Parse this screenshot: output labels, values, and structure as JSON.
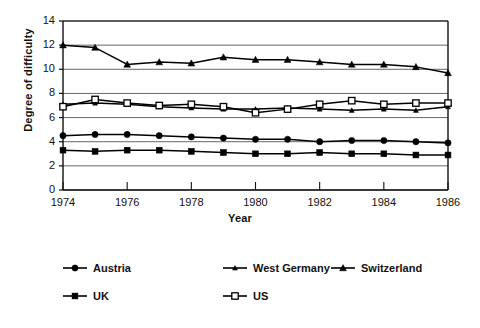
{
  "chart_data": {
    "type": "line",
    "title": "",
    "xlabel": "Year",
    "ylabel": "Degree of difficulty",
    "xlim": [
      1974,
      1986
    ],
    "ylim": [
      0,
      14
    ],
    "ytick_step": 2,
    "xtick_step": 2,
    "grid": "horizontal",
    "legend_position": "below",
    "x": [
      1974,
      1975,
      1976,
      1977,
      1978,
      1979,
      1980,
      1981,
      1982,
      1983,
      1984,
      1985,
      1986
    ],
    "xtick_labels": [
      "1974",
      "1976",
      "1978",
      "1980",
      "1982",
      "1984",
      "1986"
    ],
    "ytick_labels": [
      "0",
      "2",
      "4",
      "6",
      "8",
      "10",
      "12",
      "14"
    ],
    "series": [
      {
        "name": "Austria",
        "marker": "filled-circle",
        "color": "#000000",
        "values": [
          4.5,
          4.6,
          4.6,
          4.5,
          4.4,
          4.3,
          4.2,
          4.2,
          4.0,
          4.1,
          4.1,
          4.0,
          3.9
        ]
      },
      {
        "name": "West Germany",
        "marker": "small-triangle",
        "color": "#000000",
        "values": [
          7.1,
          7.2,
          7.1,
          6.9,
          6.8,
          6.7,
          6.7,
          6.8,
          6.7,
          6.6,
          6.7,
          6.6,
          6.9
        ]
      },
      {
        "name": "Switzerland",
        "marker": "triangle",
        "color": "#000000",
        "values": [
          12.0,
          11.8,
          10.4,
          10.6,
          10.5,
          11.0,
          10.8,
          10.8,
          10.6,
          10.4,
          10.4,
          10.2,
          9.7
        ]
      },
      {
        "name": "UK",
        "marker": "filled-square",
        "color": "#000000",
        "values": [
          3.3,
          3.2,
          3.3,
          3.3,
          3.2,
          3.1,
          3.0,
          3.0,
          3.1,
          3.0,
          3.0,
          2.9,
          2.9
        ]
      },
      {
        "name": "US",
        "marker": "open-square",
        "color": "#000000",
        "values": [
          6.9,
          7.5,
          7.2,
          7.0,
          7.1,
          6.9,
          6.4,
          6.7,
          7.1,
          7.4,
          7.1,
          7.2,
          7.2
        ]
      }
    ]
  },
  "legend": {
    "rows": [
      [
        {
          "label": "Austria",
          "marker": "filled-circle"
        },
        {
          "label": "West Germany",
          "marker": "small-triangle"
        },
        {
          "label": "Switzerland",
          "marker": "triangle"
        }
      ],
      [
        {
          "label": "UK",
          "marker": "filled-square"
        },
        {
          "label": "US",
          "marker": "open-square"
        }
      ]
    ]
  }
}
